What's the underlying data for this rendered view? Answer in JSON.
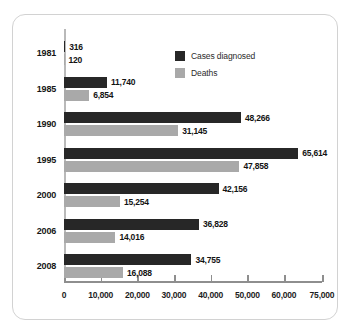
{
  "chart_data": {
    "type": "bar",
    "orientation": "horizontal",
    "title": "",
    "subtitle": "",
    "xlabel": "",
    "ylabel": "",
    "categories": [
      "1981",
      "1985",
      "1990",
      "1995",
      "2000",
      "2006",
      "2008"
    ],
    "series": [
      {
        "name": "Cases diagnosed",
        "color": "#272727",
        "values": [
          316,
          11740,
          48266,
          65614,
          42156,
          36828,
          34755
        ],
        "labels": [
          "316",
          "11,740",
          "48,266",
          "65,614",
          "42,156",
          "36,828",
          "34,755"
        ]
      },
      {
        "name": "Deaths",
        "color": "#a9a9a9",
        "values": [
          120,
          6854,
          31145,
          47858,
          15254,
          14016,
          16088
        ],
        "labels": [
          "120",
          "6,854",
          "31,145",
          "47,858",
          "15,254",
          "14,016",
          "16,088"
        ]
      }
    ],
    "xticks": [
      0,
      10000,
      20000,
      30000,
      40000,
      50000,
      60000,
      75000
    ],
    "xtick_labels": [
      "0",
      "10,000",
      "20,000",
      "30,000",
      "40,000",
      "50,000",
      "60,000",
      "75,000"
    ],
    "xlim": [
      0,
      75000
    ],
    "grid": false,
    "legend_position": "top-right"
  },
  "legend": {
    "items": [
      {
        "label": "Cases diagnosed"
      },
      {
        "label": "Deaths"
      }
    ]
  }
}
